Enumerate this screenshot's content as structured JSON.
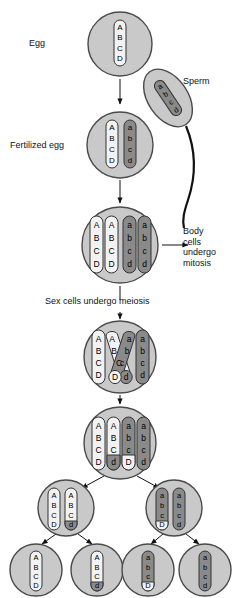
{
  "figure": {
    "topic": "Fertilization and meiosis with crossing over",
    "colors": {
      "cell_fill": "#c9c9c9",
      "cell_stroke": "#4a4a4a",
      "chromosome_light": "#f2f2f2",
      "chromosome_dark": "#8a8a8a",
      "chromosome_stroke": "#333333",
      "text": "#111111",
      "arrow": "#111111",
      "background": "#ffffff"
    }
  },
  "labels": {
    "egg": "Egg",
    "sperm": "Sperm",
    "fertilized_egg": "Fertilized egg",
    "body_cells": "Body\ncells\nundergo\nmitosis",
    "body_cells_lines": [
      "Body",
      "cells",
      "undergo",
      "mitosis"
    ],
    "sex_cells": "Sex cells undergo meiosis"
  },
  "genes": {
    "maternal": [
      "A",
      "B",
      "C",
      "D"
    ],
    "paternal": [
      "a",
      "b",
      "c",
      "d"
    ]
  },
  "stages": [
    {
      "id": "egg",
      "name": "Egg cell",
      "shape": "circle",
      "cx": 120,
      "cy": 44,
      "r": 32,
      "chromosomes": [
        {
          "letters": [
            "A",
            "B",
            "C",
            "D"
          ],
          "shades": [
            "light",
            "light",
            "light",
            "light"
          ]
        }
      ]
    },
    {
      "id": "sperm",
      "name": "Sperm cell",
      "shape": "ellipse",
      "cx": 168,
      "cy": 98,
      "rx": 20,
      "ry": 32,
      "rotate": -34,
      "chromosomes": [
        {
          "letters": [
            "a",
            "b",
            "c",
            "d"
          ],
          "shades": [
            "dark",
            "dark",
            "dark",
            "dark"
          ]
        }
      ],
      "tail": true
    },
    {
      "id": "fertilized-egg",
      "name": "Fertilized egg",
      "shape": "circle",
      "cx": 120,
      "cy": 145,
      "r": 33,
      "chromosomes": [
        {
          "letters": [
            "A",
            "B",
            "C",
            "D"
          ],
          "shades": [
            "light",
            "light",
            "light",
            "light"
          ]
        },
        {
          "letters": [
            "a",
            "b",
            "c",
            "d"
          ],
          "shades": [
            "dark",
            "dark",
            "dark",
            "dark"
          ]
        }
      ]
    },
    {
      "id": "duplicated",
      "name": "Cell with duplicated chromosomes",
      "shape": "circle",
      "cx": 120,
      "cy": 245,
      "r": 38,
      "chromosomes": [
        {
          "letters": [
            "A",
            "B",
            "C",
            "D"
          ],
          "shades": [
            "light",
            "light",
            "light",
            "light"
          ]
        },
        {
          "letters": [
            "A",
            "B",
            "C",
            "D"
          ],
          "shades": [
            "light",
            "light",
            "light",
            "light"
          ]
        },
        {
          "letters": [
            "a",
            "b",
            "c",
            "d"
          ],
          "shades": [
            "dark",
            "dark",
            "dark",
            "dark"
          ]
        },
        {
          "letters": [
            "a",
            "b",
            "c",
            "d"
          ],
          "shades": [
            "dark",
            "dark",
            "dark",
            "dark"
          ]
        }
      ]
    },
    {
      "id": "crossing-over",
      "name": "Crossing over",
      "shape": "circle",
      "cx": 120,
      "cy": 357,
      "r": 36,
      "crossing": true,
      "chromosomes": [
        {
          "letters": [
            "A",
            "B",
            "C",
            "D"
          ],
          "shades": [
            "light",
            "light",
            "light",
            "light"
          ]
        },
        {
          "letters": [
            "A",
            "B",
            "C",
            "d"
          ],
          "shades": [
            "light",
            "light",
            "light",
            "dark"
          ],
          "crossed": true
        },
        {
          "letters": [
            "a",
            "b",
            "c",
            "D"
          ],
          "shades": [
            "dark",
            "dark",
            "dark",
            "light"
          ],
          "crossed": true
        },
        {
          "letters": [
            "a",
            "b",
            "c",
            "d"
          ],
          "shades": [
            "dark",
            "dark",
            "dark",
            "dark"
          ]
        }
      ]
    },
    {
      "id": "recombined",
      "name": "Recombined chromosomes",
      "shape": "circle",
      "cx": 120,
      "cy": 443,
      "r": 36,
      "chromosomes": [
        {
          "letters": [
            "A",
            "B",
            "C",
            "D"
          ],
          "shades": [
            "light",
            "light",
            "light",
            "light"
          ]
        },
        {
          "letters": [
            "A",
            "B",
            "C",
            "d"
          ],
          "shades": [
            "light",
            "light",
            "light",
            "dark"
          ]
        },
        {
          "letters": [
            "a",
            "b",
            "c",
            "D"
          ],
          "shades": [
            "dark",
            "dark",
            "dark",
            "light"
          ]
        },
        {
          "letters": [
            "a",
            "b",
            "c",
            "d"
          ],
          "shades": [
            "dark",
            "dark",
            "dark",
            "dark"
          ]
        }
      ]
    },
    {
      "id": "daughter-left",
      "name": "Daughter cell left",
      "shape": "circle",
      "cx": 66,
      "cy": 508,
      "r": 28,
      "chromosomes": [
        {
          "letters": [
            "A",
            "B",
            "C",
            "D"
          ],
          "shades": [
            "light",
            "light",
            "light",
            "light"
          ]
        },
        {
          "letters": [
            "A",
            "B",
            "C",
            "d"
          ],
          "shades": [
            "light",
            "light",
            "light",
            "dark"
          ]
        }
      ]
    },
    {
      "id": "daughter-right",
      "name": "Daughter cell right",
      "shape": "circle",
      "cx": 174,
      "cy": 508,
      "r": 28,
      "chromosomes": [
        {
          "letters": [
            "a",
            "b",
            "c",
            "D"
          ],
          "shades": [
            "dark",
            "dark",
            "dark",
            "light"
          ]
        },
        {
          "letters": [
            "a",
            "b",
            "c",
            "d"
          ],
          "shades": [
            "dark",
            "dark",
            "dark",
            "dark"
          ]
        }
      ]
    },
    {
      "id": "gamete-1",
      "name": "Gamete 1",
      "shape": "circle",
      "cx": 36,
      "cy": 570,
      "r": 26,
      "chromosomes": [
        {
          "letters": [
            "A",
            "B",
            "C",
            "D"
          ],
          "shades": [
            "light",
            "light",
            "light",
            "light"
          ]
        }
      ]
    },
    {
      "id": "gamete-2",
      "name": "Gamete 2",
      "shape": "circle",
      "cx": 97,
      "cy": 570,
      "r": 26,
      "chromosomes": [
        {
          "letters": [
            "A",
            "B",
            "C",
            "d"
          ],
          "shades": [
            "light",
            "light",
            "light",
            "dark"
          ]
        }
      ]
    },
    {
      "id": "gamete-3",
      "name": "Gamete 3",
      "shape": "circle",
      "cx": 148,
      "cy": 570,
      "r": 26,
      "chromosomes": [
        {
          "letters": [
            "a",
            "b",
            "c",
            "D"
          ],
          "shades": [
            "dark",
            "dark",
            "dark",
            "light"
          ]
        }
      ]
    },
    {
      "id": "gamete-4",
      "name": "Gamete 4",
      "shape": "circle",
      "cx": 205,
      "cy": 570,
      "r": 26,
      "chromosomes": [
        {
          "letters": [
            "a",
            "b",
            "c",
            "d"
          ],
          "shades": [
            "dark",
            "dark",
            "dark",
            "d"
          ]
        }
      ]
    }
  ]
}
